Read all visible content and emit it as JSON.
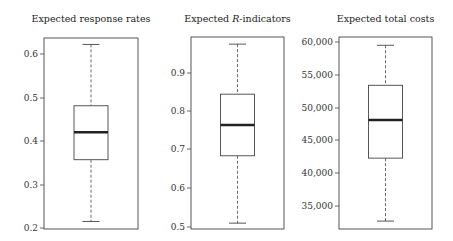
{
  "chart_data": [
    {
      "type": "boxplot",
      "title": "Expected response rates",
      "xlabel": "",
      "ylabel": "",
      "yticks": [
        0.2,
        0.3,
        0.4,
        0.5,
        0.6
      ],
      "ytick_labels": [
        "0.2",
        "0.3",
        "0.4",
        "0.5",
        "0.6"
      ],
      "ylim": [
        0.2,
        0.635
      ],
      "grid": false,
      "box": {
        "whisker_low": 0.215,
        "q1": 0.357,
        "median": 0.42,
        "q3": 0.481,
        "whisker_high": 0.622
      },
      "frame": {
        "x": 44,
        "y": 38,
        "w": 94,
        "h": 191
      },
      "tick_px": [
        228,
        185,
        141,
        98,
        54
      ]
    },
    {
      "type": "boxplot",
      "title": "Expected R-indicators",
      "title_parts": [
        "Expected ",
        "R",
        "-indicators"
      ],
      "xlabel": "",
      "ylabel": "",
      "yticks": [
        0.5,
        0.6,
        0.7,
        0.8,
        0.9
      ],
      "ytick_labels": [
        "0.5",
        "0.6",
        "0.7",
        "0.8",
        "0.9"
      ],
      "ylim": [
        0.495,
        0.99
      ],
      "grid": false,
      "box": {
        "whisker_low": 0.51,
        "q1": 0.685,
        "median": 0.765,
        "q3": 0.845,
        "whisker_high": 0.975
      },
      "frame": {
        "x": 191,
        "y": 37,
        "w": 93,
        "h": 192
      },
      "tick_px": [
        227,
        188,
        149,
        111,
        73
      ]
    },
    {
      "type": "boxplot",
      "title": "Expected total costs",
      "xlabel": "",
      "ylabel": "",
      "yticks": [
        35000,
        40000,
        45000,
        50000,
        55000,
        60000
      ],
      "ytick_labels": [
        "35,000",
        "40,000",
        "45,000",
        "50,000",
        "55,000",
        "60,000"
      ],
      "ylim": [
        31300,
        60250
      ],
      "grid": false,
      "box": {
        "whisker_low": 32700,
        "q1": 42300,
        "median": 48100,
        "q3": 53400,
        "whisker_high": 59500
      },
      "frame": {
        "x": 339,
        "y": 37,
        "w": 93,
        "h": 192
      },
      "tick_px": [
        206,
        173,
        140,
        108,
        75,
        42
      ]
    }
  ]
}
